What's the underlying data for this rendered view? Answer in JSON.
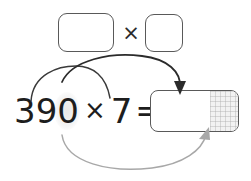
{
  "diagram": {
    "type": "arithmetic-decomposition-worksheet"
  },
  "equation": {
    "multiplicand": "390",
    "operator": "×",
    "multiplier": "7",
    "equals": "=",
    "answer_value": ""
  },
  "top_row": {
    "factor_box_1_value": "",
    "factor_box_1_placeholder": "",
    "operator_symbol": "×",
    "factor_box_2_value": "",
    "factor_box_2_placeholder": ""
  },
  "answer": {
    "value": "",
    "placeholder": "",
    "shaded_region_label": "place-value grid"
  },
  "arrows": [
    {
      "name": "arrow-390-to-factor-box-1",
      "from": "390",
      "to": "factor-box-1",
      "style": "curve",
      "color": "#3a3a3a",
      "head": "none"
    },
    {
      "name": "arrow-7-to-answer-box",
      "from": "7",
      "to": "answer-box-top",
      "style": "curve",
      "color": "#2b2b2b",
      "head": "arrow-down"
    },
    {
      "name": "arrow-zero-to-answer-box",
      "from": "390-zero-digit",
      "to": "answer-box-bottom-right",
      "style": "curve",
      "color": "#a8a8a8",
      "head": "arrow-up-right"
    }
  ],
  "colors": {
    "box_border": "#595959",
    "text": "#1d1d1d",
    "dark_arrow": "#2b2b2b",
    "light_arrow": "#a8a8a8",
    "shaded_fill": "#f2f2f2",
    "background": "#ffffff"
  }
}
